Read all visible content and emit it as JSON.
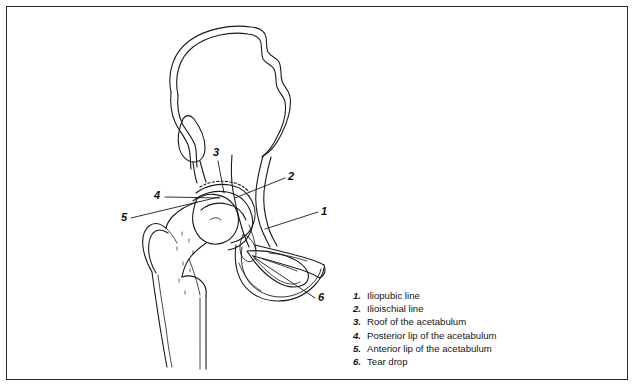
{
  "figure": {
    "background_color": "#ffffff",
    "border_color": "#2a2a2a",
    "line_color": "#1a1a1a"
  },
  "callouts": [
    {
      "id": "1",
      "label": "1",
      "x": 316,
      "y": 204,
      "target_x": 258,
      "target_y": 222
    },
    {
      "id": "2",
      "label": "2",
      "x": 283,
      "y": 169,
      "target_x": 228,
      "target_y": 190
    },
    {
      "id": "3",
      "label": "3",
      "x": 209,
      "y": 146,
      "target_x": 218,
      "target_y": 186
    },
    {
      "id": "4",
      "label": "4",
      "x": 150,
      "y": 188,
      "target_x": 213,
      "target_y": 191
    },
    {
      "id": "5",
      "label": "5",
      "x": 117,
      "y": 210,
      "target_x": 212,
      "target_y": 189
    },
    {
      "id": "6",
      "label": "6",
      "x": 313,
      "y": 290,
      "target_x": 248,
      "target_y": 250
    }
  ],
  "legend": {
    "items": [
      {
        "number": "1.",
        "text": "Iliopubic line"
      },
      {
        "number": "2.",
        "text": "Ilioischial line"
      },
      {
        "number": "3.",
        "text": "Roof of the acetabulum"
      },
      {
        "number": "4.",
        "text": "Posterior lip of the acetabulum"
      },
      {
        "number": "5.",
        "text": "Anterior lip of the acetabulum"
      },
      {
        "number": "6.",
        "text": "Tear drop"
      }
    ]
  },
  "anatomy": {
    "structures": [
      "iliac-wing",
      "iliac-crest",
      "anterior-inferior-iliac-spine",
      "acetabular-roof",
      "acetabulum",
      "femoral-head",
      "femoral-neck",
      "greater-trochanter",
      "lesser-trochanter",
      "femoral-shaft",
      "superior-pubic-ramus",
      "inferior-pubic-ramus",
      "obturator-foramen",
      "ischium",
      "tear-drop"
    ]
  }
}
